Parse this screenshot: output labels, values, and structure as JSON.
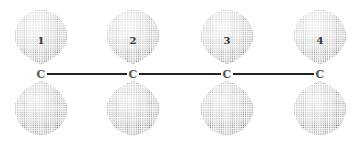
{
  "diagram": {
    "type": "p-orbital overlap, conjugated 4-carbon chain",
    "atoms": [
      {
        "label": "C",
        "number": "1",
        "x": 41,
        "y": 74
      },
      {
        "label": "C",
        "number": "2",
        "x": 133,
        "y": 74
      },
      {
        "label": "C",
        "number": "3",
        "x": 227,
        "y": 74
      },
      {
        "label": "C",
        "number": "4",
        "x": 320,
        "y": 74
      }
    ],
    "bonds": [
      {
        "from": 0,
        "to": 1
      },
      {
        "from": 1,
        "to": 2
      },
      {
        "from": 2,
        "to": 3
      }
    ],
    "colors": {
      "bond": "#222222",
      "dots": "#555555",
      "background": "#ffffff"
    }
  }
}
